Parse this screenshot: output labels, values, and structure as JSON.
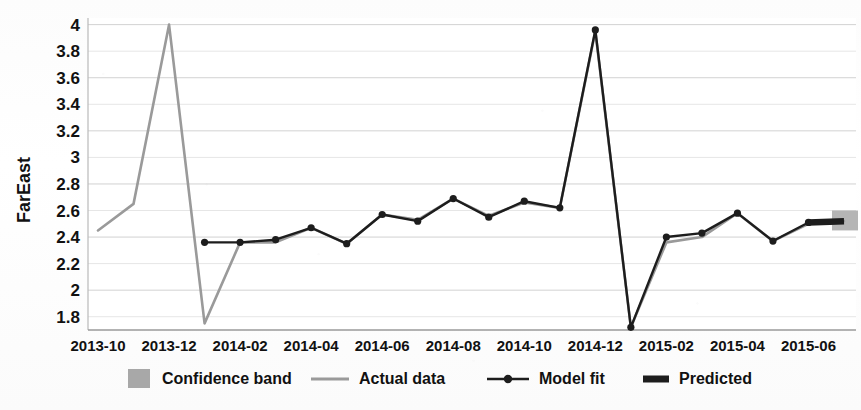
{
  "chart_data": {
    "type": "line",
    "title": "",
    "xlabel": "",
    "ylabel": "FarEast",
    "ylim": [
      1.7,
      4.05
    ],
    "ytick_labels": [
      "4",
      "3.8",
      "3.6",
      "3.4",
      "3.2",
      "3",
      "2.8",
      "2.6",
      "2.4",
      "2.2",
      "2",
      "1.8"
    ],
    "ytick_values": [
      4,
      3.8,
      3.6,
      3.4,
      3.2,
      3.0,
      2.8,
      2.6,
      2.4,
      2.2,
      2.0,
      1.8
    ],
    "xtick_labels": [
      "2013-10",
      "2013-12",
      "2014-02",
      "2014-04",
      "2014-06",
      "2014-08",
      "2014-10",
      "2014-12",
      "2015-02",
      "2015-04",
      "2015-06"
    ],
    "x": [
      "2013-10",
      "2013-11",
      "2013-12",
      "2014-01",
      "2014-02",
      "2014-03",
      "2014-04",
      "2014-05",
      "2014-06",
      "2014-07",
      "2014-08",
      "2014-09",
      "2014-10",
      "2014-11",
      "2014-12",
      "2015-01",
      "2015-02",
      "2015-03",
      "2015-04",
      "2015-05",
      "2015-06",
      "2015-07"
    ],
    "grid": true,
    "legend_position": "bottom",
    "series": [
      {
        "name": "Actual data",
        "color": "#9a9a9a",
        "style": "thin-line",
        "values": [
          2.45,
          2.65,
          4.0,
          1.75,
          2.36,
          2.36,
          2.47,
          2.35,
          2.57,
          2.53,
          2.69,
          2.56,
          2.66,
          2.62,
          3.95,
          1.72,
          2.36,
          2.4,
          2.58,
          2.37,
          2.5,
          2.52
        ]
      },
      {
        "name": "Model fit",
        "color": "#1d1d1d",
        "style": "line-with-markers",
        "values": [
          null,
          null,
          null,
          2.36,
          2.36,
          2.38,
          2.47,
          2.35,
          2.57,
          2.52,
          2.69,
          2.55,
          2.67,
          2.62,
          3.96,
          1.72,
          2.4,
          2.43,
          2.58,
          2.37,
          2.51,
          null
        ]
      },
      {
        "name": "Predicted",
        "color": "#1d1d1d",
        "style": "thick-line",
        "values": [
          null,
          null,
          null,
          null,
          null,
          null,
          null,
          null,
          null,
          null,
          null,
          null,
          null,
          null,
          null,
          null,
          null,
          null,
          null,
          null,
          2.51,
          2.52
        ]
      }
    ],
    "confidence_band": {
      "name": "Confidence band",
      "color": "#a8a8a8",
      "x": "2015-07",
      "lower": 2.45,
      "upper": 2.6
    }
  },
  "legend": {
    "items": [
      {
        "label": "Confidence band",
        "marker": "swatch",
        "color": "#a8a8a8"
      },
      {
        "label": "Actual data",
        "marker": "thin-line",
        "color": "#9a9a9a"
      },
      {
        "label": "Model fit",
        "marker": "line-dot",
        "color": "#1d1d1d"
      },
      {
        "label": "Predicted",
        "marker": "thick-line",
        "color": "#1d1d1d"
      }
    ]
  }
}
